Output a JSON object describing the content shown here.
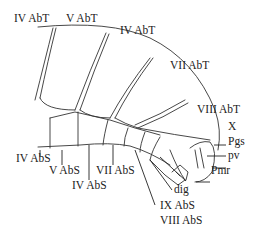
{
  "figure": {
    "tergite_labels": [
      {
        "id": "IV AbT",
        "text": "IV AbT"
      },
      {
        "id": "V AbT",
        "text": "V AbT"
      },
      {
        "id": "VI AbT",
        "text": "IV AbT"
      },
      {
        "id": "VII AbT",
        "text": "VII AbT"
      },
      {
        "id": "VIII AbT",
        "text": "VIII AbT"
      }
    ],
    "terminal_labels": [
      {
        "id": "X",
        "text": "X"
      },
      {
        "id": "Pgs",
        "text": "Pgs"
      },
      {
        "id": "pv",
        "text": "pv"
      },
      {
        "id": "Pmr",
        "text": "Pmr"
      },
      {
        "id": "dig",
        "text": "dig"
      }
    ],
    "sternite_labels": [
      {
        "id": "IV AbS",
        "text": "IV AbS"
      },
      {
        "id": "V AbS",
        "text": "V AbS"
      },
      {
        "id": "VI AbS",
        "text": "IV AbS"
      },
      {
        "id": "VII AbS",
        "text": "VII AbS"
      },
      {
        "id": "IX AbS",
        "text": "IX AbS"
      },
      {
        "id": "VIII AbS",
        "text": "VIII AbS"
      }
    ]
  }
}
